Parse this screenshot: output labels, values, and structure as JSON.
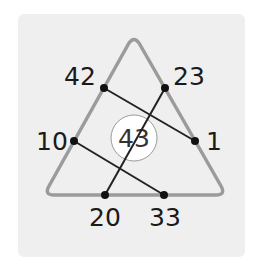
{
  "puzzle": {
    "type": "triangle-number-puzzle",
    "center_value": "43",
    "points": [
      {
        "id": "p42",
        "label": "42",
        "x": 104,
        "y": 88
      },
      {
        "id": "p23",
        "label": "23",
        "x": 165,
        "y": 88
      },
      {
        "id": "p10",
        "label": "10",
        "x": 74,
        "y": 141
      },
      {
        "id": "p1",
        "label": "1",
        "x": 195,
        "y": 141
      },
      {
        "id": "p20",
        "label": "20",
        "x": 105,
        "y": 195
      },
      {
        "id": "p33",
        "label": "33",
        "x": 164,
        "y": 195
      }
    ],
    "connections": [
      [
        "42",
        "1"
      ],
      [
        "23",
        "20"
      ],
      [
        "10",
        "33"
      ]
    ],
    "colors": {
      "panel": "#efefef",
      "triangle": "#9b9b9b",
      "line": "#222222",
      "circle_fill": "#ffffff",
      "circle_stroke": "#9a9a9a"
    }
  }
}
